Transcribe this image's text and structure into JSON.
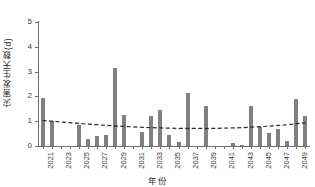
{
  "chart_data": {
    "type": "bar",
    "title": "",
    "subtitle": "",
    "xlabel": "年份",
    "ylabel": "灾害发生天数(d)",
    "ylim": [
      0,
      5
    ],
    "yticks": [
      0,
      1,
      2,
      3,
      4,
      5
    ],
    "ytick_labels": [
      "0",
      "1",
      "2",
      "3",
      "4",
      "5"
    ],
    "xlim": [
      2020.5,
      2050.5
    ],
    "xtick_labels": [
      "2021",
      "2023",
      "2025",
      "2027",
      "2029",
      "2031",
      "2033",
      "2035",
      "2037",
      "2039",
      "2041",
      "2043",
      "2045",
      "2047",
      "2049"
    ],
    "grid": false,
    "legend": "none",
    "bar_color": "#808080",
    "trend_color": "#2b2b2b",
    "categories": [
      "2021",
      "2022",
      "2023",
      "2024",
      "2025",
      "2026",
      "2027",
      "2028",
      "2029",
      "2030",
      "2031",
      "2032",
      "2033",
      "2034",
      "2035",
      "2036",
      "2037",
      "2038",
      "2039",
      "2040",
      "2041",
      "2042",
      "2043",
      "2044",
      "2045",
      "2046",
      "2047",
      "2048",
      "2049",
      "2050"
    ],
    "values": [
      1.95,
      1.0,
      0,
      0,
      0.85,
      0.27,
      0.42,
      0.45,
      3.15,
      1.25,
      0,
      0.57,
      1.2,
      1.45,
      0.45,
      0.17,
      2.15,
      0,
      1.63,
      0,
      0,
      0.12,
      0.03,
      1.6,
      0.77,
      0.53,
      0.68,
      0.2,
      1.9,
      1.2
    ],
    "series": [
      {
        "name": "灾害发生天数",
        "type": "bar",
        "values": [
          1.95,
          1.0,
          0,
          0,
          0.85,
          0.27,
          0.42,
          0.45,
          3.15,
          1.25,
          0,
          0.57,
          1.2,
          1.45,
          0.45,
          0.17,
          2.15,
          0,
          1.63,
          0,
          0,
          0.12,
          0.03,
          1.6,
          0.77,
          0.53,
          0.68,
          0.2,
          1.9,
          1.2
        ]
      },
      {
        "name": "趋势线",
        "type": "line",
        "style": "dashed",
        "values": [
          1.03,
          1.0,
          0.97,
          0.94,
          0.91,
          0.88,
          0.86,
          0.83,
          0.81,
          0.79,
          0.77,
          0.75,
          0.74,
          0.73,
          0.72,
          0.71,
          0.71,
          0.71,
          0.71,
          0.71,
          0.72,
          0.73,
          0.74,
          0.76,
          0.78,
          0.8,
          0.83,
          0.86,
          0.9,
          0.94
        ]
      }
    ]
  }
}
